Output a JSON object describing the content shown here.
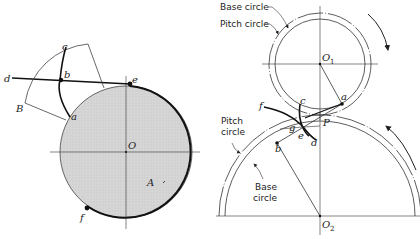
{
  "left_figure": {
    "center_label": "O",
    "region_label": "A",
    "points": {
      "a": "a",
      "b": "b",
      "c": "c",
      "d": "d",
      "e": "e",
      "f": "f"
    },
    "corner_label": "B"
  },
  "right_figure": {
    "upper_gear": {
      "center_label": "O",
      "center_subscript": "1"
    },
    "lower_gear": {
      "center_label": "O",
      "center_subscript": "2"
    },
    "pitch_point": "P",
    "points": {
      "a": "a",
      "b": "b",
      "c": "c",
      "d": "d",
      "e": "e",
      "f": "f",
      "g": "g"
    },
    "callouts": {
      "base_circle_top": "Base circle",
      "pitch_circle_top": "Pitch circle",
      "pitch_circle_lower_1": "Pitch",
      "pitch_circle_lower_2": "circle",
      "base_circle_lower_1": "Base",
      "base_circle_lower_2": "circle"
    }
  },
  "colors": {
    "shade": "#d4d4d4",
    "line": "#222222"
  }
}
